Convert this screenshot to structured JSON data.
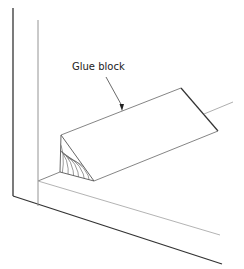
{
  "diagram": {
    "labels": [
      {
        "text": "Glue block",
        "target": "glue-block"
      }
    ],
    "parts": [
      "outer-panel",
      "inner-panel",
      "bottom-panel",
      "glue-block",
      "end-grain-hatch"
    ],
    "colors": {
      "background": "#ffffff",
      "heavy_line": "#333333",
      "light_line": "#999999",
      "text": "#222222"
    }
  }
}
